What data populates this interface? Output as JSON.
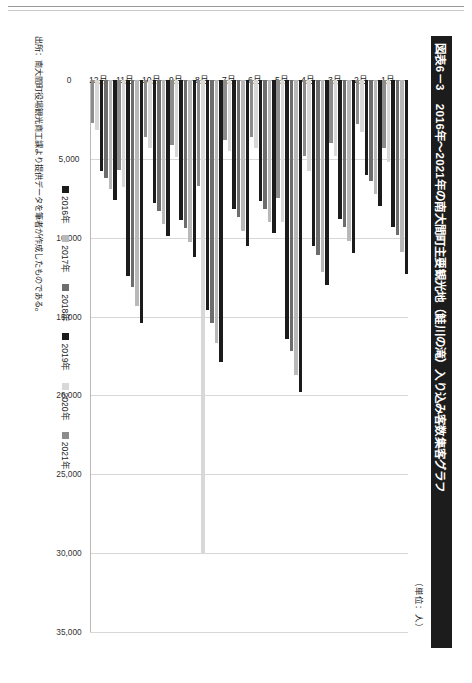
{
  "page": {
    "figure_number": "図表6－3",
    "figure_title": "2016年〜2021年の南大間町主要観光地（鮭川の滝）入り込み客数集客グラフ",
    "unit_note": "（単位：人）",
    "source_note": "出所：南大間町役場観光商工課より提供データを筆者が作成したものである。"
  },
  "chart_data": {
    "type": "bar",
    "orientation": "horizontal",
    "title": "2016年〜2021年の南大間町主要観光地（鮭川の滝）入り込み客数集客グラフ",
    "xlabel": "",
    "ylabel": "",
    "unit": "人",
    "grid": true,
    "legend_position": "bottom",
    "xlim": [
      0,
      35000
    ],
    "xticks": [
      0,
      5000,
      10000,
      15000,
      20000,
      25000,
      30000,
      35000
    ],
    "xtick_labels": [
      "0",
      "5,000",
      "10,000",
      "15,000",
      "20,000",
      "25,000",
      "30,000",
      "35,000"
    ],
    "categories": [
      "1月",
      "2月",
      "3月",
      "4月",
      "5月",
      "6月",
      "7月",
      "8月",
      "9月",
      "10月",
      "11月",
      "12月"
    ],
    "series": [
      {
        "name": "2016年",
        "color": "#1b1b1b",
        "values": [
          12300,
          8000,
          11000,
          13000,
          19800,
          9700,
          10500,
          17900,
          11200,
          9900,
          15400,
          7600
        ]
      },
      {
        "name": "2017年",
        "color": "#b9b9b9",
        "values": [
          10900,
          7200,
          10200,
          12200,
          18700,
          9000,
          9600,
          16700,
          10300,
          9100,
          14300,
          6900
        ]
      },
      {
        "name": "2018年",
        "color": "#6d6d6d",
        "values": [
          9800,
          6400,
          9300,
          11100,
          17200,
          8200,
          8700,
          15400,
          9400,
          8300,
          13100,
          6200
        ]
      },
      {
        "name": "2019年",
        "color": "#1b1b1b",
        "values": [
          9300,
          6000,
          8800,
          10500,
          16400,
          7700,
          8200,
          14600,
          8900,
          7800,
          12400,
          5800
        ]
      },
      {
        "name": "2020年",
        "color": "#d8d8d8",
        "values": [
          5200,
          3300,
          4800,
          5800,
          9000,
          4300,
          4500,
          30000,
          4900,
          4300,
          6800,
          3200
        ]
      },
      {
        "name": "2021年",
        "color": "#8c8c8c",
        "values": [
          4300,
          2800,
          4000,
          4800,
          7500,
          3600,
          3800,
          6700,
          4100,
          3600,
          5700,
          2700
        ]
      }
    ]
  }
}
